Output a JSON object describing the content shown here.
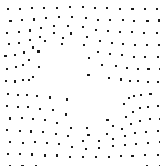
{
  "figure": {
    "title": "Dot lattice with radial distortion",
    "kind": "dot-pattern-illusion",
    "width": 160,
    "height": 166,
    "background_color": "#ffffff",
    "dot_color": "#1a1a1a",
    "dot_size_px": 2.1,
    "dot_shape": "square"
  },
  "chart_data": {
    "type": "scatter",
    "title": "Dot lattice with radial distortion",
    "subtitle": "",
    "xlabel": "",
    "ylabel": "",
    "xlim": [
      0,
      160
    ],
    "ylim": [
      0,
      166
    ],
    "grid": false,
    "legend": null,
    "annotations": [],
    "marker": {
      "shape": "square",
      "size_px": 2.1,
      "color": "#1a1a1a"
    },
    "lattice": {
      "columns": 13,
      "rows": 14,
      "spacing_x": 12.4,
      "spacing_y": 12.1,
      "origin_x": 8.0,
      "origin_y": 9.0,
      "row_stagger_x": 2.6
    },
    "distortion": {
      "model": "radial-pinch-quadrupole",
      "center_x": 79.0,
      "center_y": 86.0,
      "radius": 52.0,
      "radial_strength": 0.46,
      "quadrupole_strength": 0.3,
      "quadrupole_phase_deg": 45.0,
      "jitter_amplitude": 0.55,
      "jitter_seed": 20240917,
      "description": "Square dot lattice displaced outward from the centre with a four-lobed (X / butterfly shaped) modulation, leaving sparse voids along the diagonals near the middle of the field."
    }
  }
}
